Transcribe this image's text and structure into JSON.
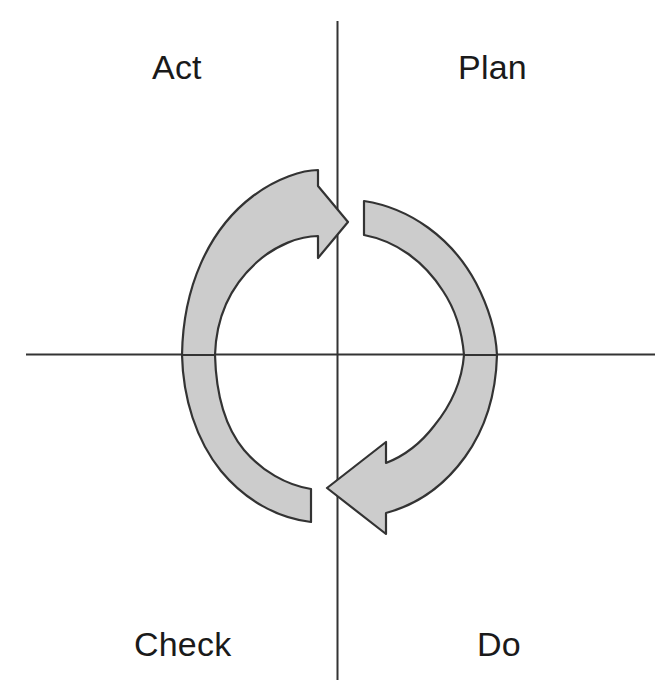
{
  "diagram": {
    "name": "PDCA cycle",
    "type": "cycle-quadrant-diagram",
    "background_color": "#ffffff",
    "axis_color": "#333333",
    "arrow_fill_color": "#cccccc",
    "arrow_stroke_color": "#333333",
    "label_color": "#1a1a1a",
    "center": {
      "x": 340,
      "y": 355
    },
    "ring_outer_radius": 158
  },
  "axes": {
    "vertical": {
      "x": 337,
      "y_start": 21,
      "y_end": 680
    },
    "horizontal": {
      "y": 354,
      "x_start": 26,
      "x_end": 655
    }
  },
  "quadrants": [
    {
      "id": "act",
      "label": "Act",
      "position": "upper-left"
    },
    {
      "id": "plan",
      "label": "Plan",
      "position": "upper-right"
    },
    {
      "id": "check",
      "label": "Check",
      "position": "lower-left"
    },
    {
      "id": "do",
      "label": "Do",
      "position": "lower-right"
    }
  ],
  "arrows": [
    {
      "id": "upper-arrow",
      "direction": "counterclockwise-to-clockwise-top",
      "points_to": "right",
      "tip": {
        "x": 348,
        "y": 222
      },
      "tail_edge_x": 364,
      "description": "Upper curved band sweeping from the right quadrant around the left side, ending in a right-pointing arrowhead crossing the vertical axis at the top"
    },
    {
      "id": "lower-arrow",
      "direction": "clockwise-bottom",
      "points_to": "left",
      "tip": {
        "x": 327,
        "y": 488
      },
      "tail_edge_x": 311,
      "description": "Lower curved band sweeping from the right side down and around, ending in a left-pointing arrowhead crossing the vertical axis at the bottom"
    }
  ]
}
